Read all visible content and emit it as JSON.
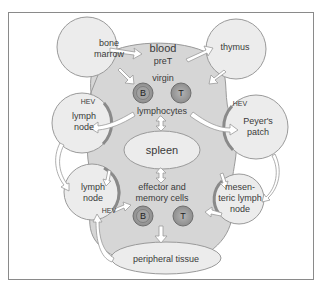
{
  "diagram": {
    "colors": {
      "blood_fill": "#d6d6d6",
      "organ_fill": "#ececec",
      "outline": "#9a9a9a",
      "hev": "#8a8a8a",
      "cell_fill": "#9c9c9c",
      "arrow_fill": "#ffffff"
    },
    "nodes": {
      "blood": "blood",
      "pret": "preT",
      "bone_marrow_1": "bone",
      "bone_marrow_2": "marrow",
      "thymus": "thymus",
      "virgin": "virgin",
      "lymphocytes": "lymphocytes",
      "lymph_node_top_1": "lymph",
      "lymph_node_top_2": "node",
      "peyers_patch_1": "Peyer's",
      "peyers_patch_2": "patch",
      "spleen": "spleen",
      "lymph_node_bottom_1": "lymph",
      "lymph_node_bottom_2": "node",
      "effector_1": "effector and",
      "effector_2": "memory cells",
      "mesenteric_1": "mesen-",
      "mesenteric_2": "teric lymph",
      "mesenteric_3": "node",
      "peripheral_tissue": "peripheral tissue"
    },
    "cells": {
      "b_virgin": "B",
      "t_virgin": "T",
      "b_effector": "B",
      "t_effector": "T"
    },
    "hev_labels": {
      "top_left": "HEV",
      "top_right": "HEV",
      "bottom_left": "HEV"
    }
  }
}
